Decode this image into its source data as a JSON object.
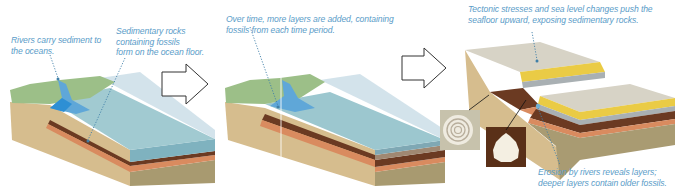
{
  "diagram": {
    "type": "process-sequence",
    "panels": [
      {
        "id": 1,
        "annotations": [
          {
            "name": "rivers",
            "lines": [
              "Rivers carry sediment to",
              "the oceans."
            ]
          },
          {
            "name": "sedimentary",
            "lines": [
              "Sedimentary rocks",
              "containing fossils",
              "form on the ocean floor."
            ]
          }
        ]
      },
      {
        "id": 2,
        "annotations": [
          {
            "name": "layers",
            "lines": [
              "Over time, more layers are added, containing",
              "fossils from each time period."
            ]
          }
        ]
      },
      {
        "id": 3,
        "annotations": [
          {
            "name": "tectonic",
            "lines": [
              "Tectonic stresses and sea level changes push the",
              "seafloor upward, exposing sedimentary rocks."
            ]
          },
          {
            "name": "erosion",
            "lines": [
              "Erosion by rivers reveals layers;",
              "deeper layers contain older fossils."
            ]
          }
        ],
        "fossils": [
          "spiral-snail-shell",
          "scallop-clam-shell"
        ]
      }
    ],
    "arrows": [
      "panel-1-to-2",
      "panel-2-to-3"
    ],
    "colors": {
      "label_text": "#5a9cc8",
      "land_green": "#9cc08a",
      "sand": "#d8bf92",
      "water": "#8fc3cf",
      "water_deep": "#5fa7d8",
      "layer_brown": "#6b3a22",
      "layer_orange": "#d98b5f",
      "layer_yellow": "#eacb45",
      "layer_gray": "#a9b0b3",
      "top_gray": "#d7d3c6",
      "bedrock": "#a99b72"
    }
  }
}
